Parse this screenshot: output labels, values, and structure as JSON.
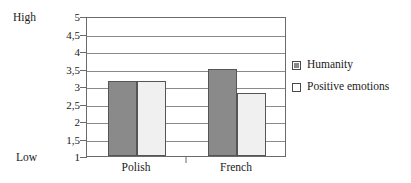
{
  "chart_data": {
    "type": "bar",
    "title": "",
    "subtitle": "",
    "xlabel": "",
    "ylabel": "",
    "categories": [
      "Polish",
      "French"
    ],
    "series": [
      {
        "name": "Humanity",
        "values": [
          3.15,
          3.5
        ],
        "color": "#8a8a8a"
      },
      {
        "name": "Positive emotions",
        "values": [
          3.15,
          2.8
        ],
        "color": "#f0f0f0"
      }
    ],
    "ylim": [
      1,
      5
    ],
    "ytick_step": 0.5,
    "ytick_labels": [
      "1",
      "1,5",
      "2",
      "2,5",
      "3",
      "3,5",
      "4",
      "4,5",
      "5"
    ],
    "ytick_values": [
      1,
      1.5,
      2,
      2.5,
      3,
      3.5,
      4,
      4.5,
      5
    ],
    "grid": true,
    "grid_orientation": "horizontal",
    "legend_position": "right",
    "axis_anchor_high": "High",
    "axis_anchor_low": "Low"
  },
  "legend": {
    "entries": [
      {
        "label": "Humanity",
        "swatch": "filled-gray-square"
      },
      {
        "label": "Positive emotions",
        "swatch": "outlined-white-square"
      }
    ]
  },
  "colors": {
    "series_humanity": "#8a8a8a",
    "series_positive_emotions": "#f0f0f0",
    "gridline": "#8a8a8a",
    "axis": "#6b6b6b",
    "bar_outline": "#555555",
    "text": "#1a1a1a",
    "background": "#ffffff"
  }
}
